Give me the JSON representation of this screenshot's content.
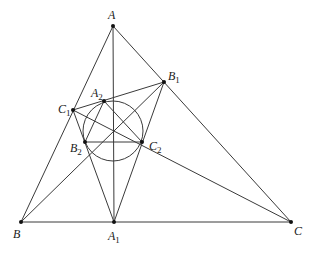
{
  "diagram": {
    "type": "geometry-triangle",
    "points": {
      "A": {
        "label": "A",
        "sub": "",
        "x": 113,
        "y": 26,
        "lx": 108,
        "ly": 19
      },
      "B": {
        "label": "B",
        "sub": "",
        "x": 21,
        "y": 222,
        "lx": 13,
        "ly": 238
      },
      "C": {
        "label": "C",
        "sub": "",
        "x": 291,
        "y": 222,
        "lx": 294,
        "ly": 235
      },
      "A1": {
        "label": "A",
        "sub": "1",
        "x": 114,
        "y": 222,
        "lx": 108,
        "ly": 240
      },
      "B1": {
        "label": "B",
        "sub": "1",
        "x": 164,
        "y": 82,
        "lx": 168,
        "ly": 80
      },
      "C1": {
        "label": "C",
        "sub": "1",
        "x": 73,
        "y": 110,
        "lx": 58,
        "ly": 113
      },
      "A2": {
        "label": "A",
        "sub": "2",
        "x": 104,
        "y": 101,
        "lx": 91,
        "ly": 97
      },
      "B2": {
        "label": "B",
        "sub": "2",
        "x": 85,
        "y": 142,
        "lx": 70,
        "ly": 152
      },
      "C2": {
        "label": "C",
        "sub": "2",
        "x": 142,
        "y": 142,
        "lx": 149,
        "ly": 150
      }
    },
    "segments": [
      [
        "A",
        "B"
      ],
      [
        "A",
        "C"
      ],
      [
        "B",
        "C"
      ],
      [
        "A",
        "A1"
      ],
      [
        "B",
        "B1"
      ],
      [
        "C",
        "C1"
      ],
      [
        "A1",
        "B1"
      ],
      [
        "A1",
        "C1"
      ],
      [
        "B1",
        "C1"
      ],
      [
        "A2",
        "B2"
      ],
      [
        "A2",
        "C2"
      ],
      [
        "B2",
        "C2"
      ]
    ],
    "circle": {
      "cx": 113,
      "cy": 131,
      "r": 30
    },
    "colors": {
      "line": "#3a3a3a",
      "point": "#111111",
      "text": "#1a1a1a",
      "background": "#ffffff"
    }
  }
}
